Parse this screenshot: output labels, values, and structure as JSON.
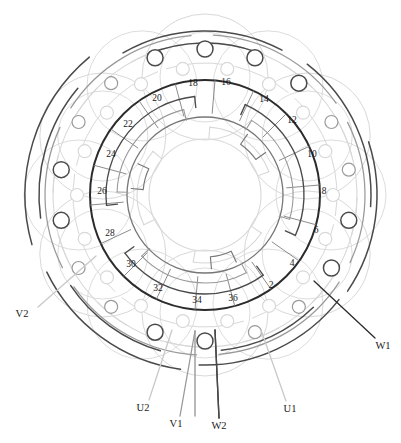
{
  "figure": {
    "type": "stator-winding-diagram",
    "title": "",
    "slot_count": 36,
    "background": "#ffffff"
  },
  "geometry": {
    "center_x": 205,
    "center_y": 195,
    "stator_outer_r": 115,
    "stator_inner_r": 78,
    "bore_r": 56,
    "coil_ring_r1": 99,
    "coil_ring_r2": 88,
    "coil_ring_r3": 68,
    "terminal_ring_r": 128,
    "terminal_ring_r2": 146,
    "slot_label_r": 96,
    "slot_angle_step": 10,
    "first_slot_angle_deg": 85
  },
  "colors": {
    "core_dark": "#2b2b2b",
    "phase_u": "#9a9a9a",
    "phase_v": "#c9c9c9",
    "phase_w": "#4a4a4a",
    "mid_gray": "#777777",
    "light_gray": "#d8d8d8",
    "text": "#1a1a1a",
    "leader": "#8a8a8a"
  },
  "slots": {
    "label": "Stator slot numbers (even, counter-clockwise)",
    "numbers": [
      2,
      4,
      6,
      8,
      10,
      12,
      14,
      16,
      18,
      20,
      22,
      24,
      26,
      28,
      30,
      32,
      34,
      36
    ],
    "angles_deg": [
      -68,
      -48,
      -28,
      -10,
      10,
      30,
      50,
      70,
      88,
      110,
      130,
      150,
      170,
      190,
      210,
      230,
      250,
      270
    ],
    "positions": [
      {
        "n": 2,
        "x": 271,
        "y": 286
      },
      {
        "n": 4,
        "x": 292,
        "y": 264
      },
      {
        "n": 6,
        "x": 316,
        "y": 231
      },
      {
        "n": 8,
        "x": 324,
        "y": 192
      },
      {
        "n": 10,
        "x": 312,
        "y": 155
      },
      {
        "n": 12,
        "x": 292,
        "y": 121
      },
      {
        "n": 14,
        "x": 264,
        "y": 100
      },
      {
        "n": 16,
        "x": 226,
        "y": 83
      },
      {
        "n": 18,
        "x": 193,
        "y": 84
      },
      {
        "n": 20,
        "x": 157,
        "y": 99
      },
      {
        "n": 22,
        "x": 128,
        "y": 125
      },
      {
        "n": 24,
        "x": 111,
        "y": 155
      },
      {
        "n": 26,
        "x": 102,
        "y": 192
      },
      {
        "n": 28,
        "x": 110,
        "y": 234
      },
      {
        "n": 30,
        "x": 131,
        "y": 265
      },
      {
        "n": 32,
        "x": 158,
        "y": 289
      },
      {
        "n": 34,
        "x": 197,
        "y": 301
      },
      {
        "n": 36,
        "x": 233,
        "y": 299
      }
    ]
  },
  "terminals": {
    "label": "Phase lead labels",
    "items": [
      {
        "id": "V2",
        "text": "V2",
        "x": 22,
        "y": 315,
        "lead_x1": 38,
        "lead_y1": 307,
        "lead_x2": 96,
        "lead_y2": 256,
        "color": "#c9c9c9"
      },
      {
        "id": "W1",
        "text": "W1",
        "x": 383,
        "y": 347,
        "lead_x1": 375,
        "lead_y1": 338,
        "lead_x2": 314,
        "lead_y2": 281,
        "color": "#2b2b2b"
      },
      {
        "id": "U2",
        "text": "U2",
        "x": 143,
        "y": 409,
        "lead_x1": 149,
        "lead_y1": 400,
        "lead_x2": 172,
        "lead_y2": 330,
        "color": "#c9c9c9"
      },
      {
        "id": "V1",
        "text": "V1",
        "x": 176,
        "y": 425,
        "lead_x1": 180,
        "lead_y1": 416,
        "lead_x2": 195,
        "lead_y2": 331,
        "color": "#9a9a9a"
      },
      {
        "id": "W2",
        "text": "W2",
        "x": 219,
        "y": 427,
        "lead_x1": 219,
        "lead_y1": 418,
        "lead_x2": 215,
        "lead_y2": 330,
        "color": "#2b2b2b"
      },
      {
        "id": "U1",
        "text": "U1",
        "x": 290,
        "y": 410,
        "lead_x1": 286,
        "lead_y1": 401,
        "lead_x2": 261,
        "lead_y2": 330,
        "color": "#c9c9c9"
      }
    ]
  },
  "nodes": {
    "label": "Winding terminal nodes (small circles on outer rings)",
    "ring_inner_count": 18,
    "ring_outer_count": 18,
    "radius_small": 6.5,
    "radius_large": 8
  }
}
